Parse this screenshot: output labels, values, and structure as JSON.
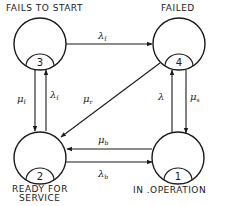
{
  "colors": {
    "ink": "#1a1a1a",
    "background": "#ffffff"
  },
  "states": [
    {
      "id": 1,
      "number": "1",
      "label": "IN  .OPERATION"
    },
    {
      "id": 2,
      "number": "2",
      "label_line1": "READY FOR",
      "label_line2": "SERVICE"
    },
    {
      "id": 3,
      "number": "3",
      "label": "FAILS TO START"
    },
    {
      "id": 4,
      "number": "4",
      "label": "FAILED"
    }
  ],
  "transitions": [
    {
      "from": "3",
      "to": "4",
      "symbol": "λ",
      "subscript": "f"
    },
    {
      "from": "3",
      "to": "2",
      "symbol": "μ",
      "subscript": "f"
    },
    {
      "from": "2",
      "to": "3",
      "symbol": "λ",
      "subscript": "f"
    },
    {
      "from": "4",
      "to": "2",
      "symbol": "μ",
      "subscript": "r"
    },
    {
      "from": "1",
      "to": "4",
      "symbol": "λ",
      "subscript": ""
    },
    {
      "from": "4",
      "to": "1",
      "symbol": "μ",
      "subscript": "s"
    },
    {
      "from": "1",
      "to": "2",
      "symbol": "μ",
      "subscript": "b"
    },
    {
      "from": "2",
      "to": "1",
      "symbol": "λ",
      "subscript": "b"
    }
  ]
}
